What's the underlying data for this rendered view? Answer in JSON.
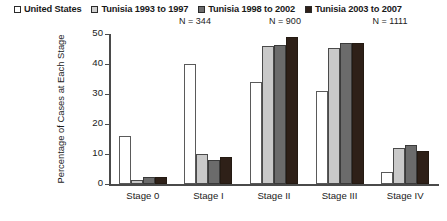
{
  "legend": {
    "items": [
      {
        "label": "United States",
        "swatch": "white-square-icon",
        "color": "#ffffff",
        "n": ""
      },
      {
        "label": "Tunisia 1993 to 1997",
        "swatch": "light-gray-square-icon",
        "color": "#cfcfcf",
        "n": "N = 344"
      },
      {
        "label": "Tunisia 1998 to 2002",
        "swatch": "mid-gray-square-icon",
        "color": "#6e6e6e",
        "n": "N = 900"
      },
      {
        "label": "Tunisia 2003 to 2007",
        "swatch": "dark-square-icon",
        "color": "#2e2018",
        "n": "N = 1111"
      }
    ]
  },
  "chart_data": {
    "type": "bar",
    "title": "",
    "xlabel": "",
    "ylabel": "Percentage of Cases at Each Stage",
    "categories": [
      "Stage 0",
      "Stage I",
      "Stage II",
      "Stage III",
      "Stage IV"
    ],
    "series": [
      {
        "name": "United States",
        "color": "#ffffff",
        "values": [
          16,
          40,
          34,
          31,
          4
        ]
      },
      {
        "name": "Tunisia 1993 to 1997",
        "color": "#c9c9c9",
        "values": [
          1.5,
          10,
          46,
          45.5,
          12
        ]
      },
      {
        "name": "Tunisia 1998 to 2002",
        "color": "#6b6b6b",
        "values": [
          2.5,
          8,
          46.5,
          47,
          13
        ]
      },
      {
        "name": "Tunisia 2003 to 2007",
        "color": "#2e2018",
        "values": [
          2.5,
          9,
          49,
          47,
          11
        ]
      }
    ],
    "ylim": [
      0,
      50
    ],
    "yticks": [
      0,
      10,
      20,
      30,
      40,
      50
    ],
    "grid": false,
    "legend_position": "top"
  }
}
